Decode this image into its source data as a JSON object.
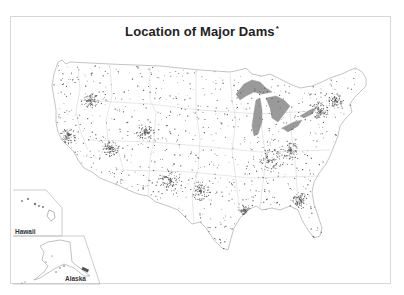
{
  "map": {
    "title": "Location of Major Dams",
    "title_marker": "*",
    "insets": [
      {
        "name": "Hawaii",
        "label": "Hawaii"
      },
      {
        "name": "Alaska",
        "label": "Alaska"
      }
    ],
    "colors": {
      "background": "#ffffff",
      "frame": "#d8d8d8",
      "state_outline": "#b8b8b8",
      "dam_marker": "#5a5a5a",
      "lake_fill": "#9a9a9a",
      "title_text": "#222222"
    },
    "legend": {
      "marker": "dam-point",
      "description": "Each dot represents a major dam"
    }
  }
}
